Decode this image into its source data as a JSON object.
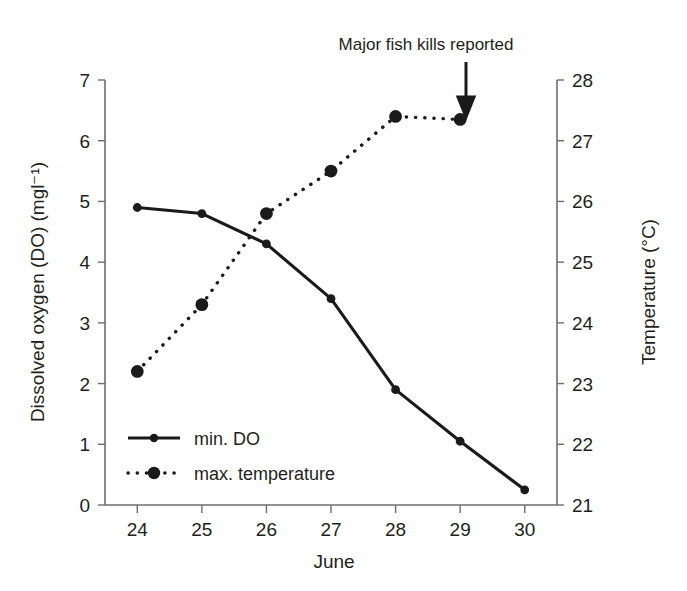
{
  "chart_data": {
    "type": "line",
    "title": "",
    "annotation": "Major fish kills reported",
    "annotation_target_x": 29,
    "xlabel": "June",
    "x": [
      24,
      25,
      26,
      27,
      28,
      29,
      30
    ],
    "xticklabels": [
      "24",
      "25",
      "26",
      "27",
      "28",
      "29",
      "30"
    ],
    "xlim": [
      23.5,
      30.5
    ],
    "grid": false,
    "legend_position": "lower-left-inside",
    "axes": {
      "left": {
        "label": "Dissolved oxygen (DO) (mgl⁻¹)",
        "ylim": [
          0,
          7
        ],
        "ticks": [
          0,
          1,
          2,
          3,
          4,
          5,
          6,
          7
        ],
        "ticklabels": [
          "0",
          "1",
          "2",
          "3",
          "4",
          "5",
          "6",
          "7"
        ]
      },
      "right": {
        "label": "Temperature (°C)",
        "ylim": [
          21,
          28
        ],
        "ticks": [
          21,
          22,
          23,
          24,
          25,
          26,
          27,
          28
        ],
        "ticklabels": [
          "21",
          "22",
          "23",
          "24",
          "25",
          "26",
          "27",
          "28"
        ]
      }
    },
    "series": [
      {
        "name": "min. DO",
        "legend_label": "min. DO",
        "axis": "left",
        "line_style": "solid",
        "marker": "circle-small",
        "color": "#1a1a1a",
        "x": [
          24,
          25,
          26,
          27,
          28,
          29,
          30
        ],
        "values": [
          4.9,
          4.8,
          4.3,
          3.4,
          1.9,
          1.05,
          0.25
        ]
      },
      {
        "name": "max. temperature",
        "legend_label": "max. temperature",
        "axis": "right",
        "line_style": "dotted",
        "marker": "circle-large",
        "color": "#1a1a1a",
        "x": [
          24,
          25,
          26,
          27,
          28,
          29
        ],
        "values": [
          23.2,
          24.3,
          25.8,
          26.5,
          27.4,
          27.35
        ]
      }
    ]
  },
  "colors": {
    "ink": "#1a1a1a",
    "axis": "#6d6e71",
    "background": "#ffffff"
  }
}
